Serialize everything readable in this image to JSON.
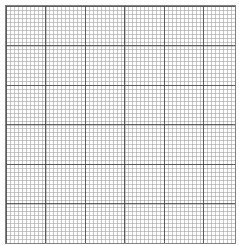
{
  "page": {
    "width_px": 239,
    "height_px": 246,
    "background_color": "#ffffff"
  },
  "grid": {
    "name": "graph-paper",
    "box": {
      "left_px": 5,
      "top_px": 5,
      "width_px": 231,
      "height_px": 239,
      "border_color": "#808080",
      "border_width_px": 1,
      "fill_color": "#ffffff"
    },
    "minor": {
      "label": "minor gridline",
      "spacing_px": 3.95,
      "line_width_px": 1,
      "color": "#9b9b9b",
      "columns": 58,
      "rows": 60
    },
    "major": {
      "label": "major gridline",
      "spacing_px": 39.5,
      "minor_cells_per_major": 10,
      "line_width_px": 1,
      "color": "#4a4a4a",
      "vertical_positions_px": [
        5,
        44,
        84,
        123,
        163,
        202
      ],
      "horizontal_positions_px": [
        5,
        45,
        84,
        124,
        163,
        203,
        242
      ],
      "vertical_count": 6,
      "horizontal_count": 7
    }
  },
  "chart_data": {
    "type": "table",
    "xlabel": "",
    "ylabel": "",
    "categories": [],
    "values": []
  }
}
